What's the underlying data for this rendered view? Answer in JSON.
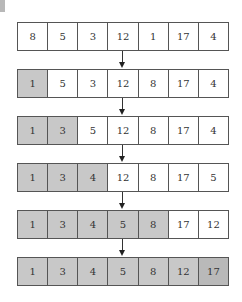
{
  "colors": {
    "sorted_fill": "#c8c8c8",
    "final_fill": "#b9b9b9",
    "unsorted_fill": "#ffffff",
    "border": "#555555"
  },
  "rows": [
    {
      "values": [
        "8",
        "5",
        "3",
        "12",
        "1",
        "17",
        "4"
      ],
      "sorted_count": 0
    },
    {
      "values": [
        "1",
        "5",
        "3",
        "12",
        "8",
        "17",
        "4"
      ],
      "sorted_count": 1
    },
    {
      "values": [
        "1",
        "3",
        "5",
        "12",
        "8",
        "17",
        "4"
      ],
      "sorted_count": 2
    },
    {
      "values": [
        "1",
        "3",
        "4",
        "12",
        "8",
        "17",
        "5"
      ],
      "sorted_count": 3
    },
    {
      "values": [
        "1",
        "3",
        "4",
        "5",
        "8",
        "17",
        "12"
      ],
      "sorted_count": 5
    },
    {
      "values": [
        "1",
        "3",
        "4",
        "5",
        "8",
        "12",
        "17"
      ],
      "sorted_count": 7
    }
  ]
}
